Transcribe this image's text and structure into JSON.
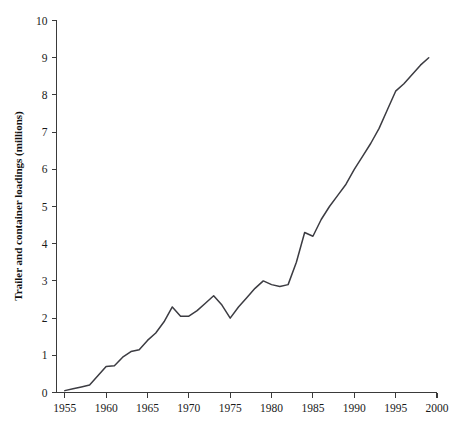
{
  "chart_data": {
    "type": "line",
    "title": "",
    "subtitle": "",
    "xlabel": "",
    "ylabel": "Trailer and container loadings (millions)",
    "xlim": [
      1954,
      2000
    ],
    "ylim": [
      0,
      10
    ],
    "xticks": [
      1955,
      1960,
      1965,
      1970,
      1975,
      1980,
      1985,
      1990,
      1995,
      2000
    ],
    "yticks": [
      0,
      1,
      2,
      3,
      4,
      5,
      6,
      7,
      8,
      9,
      10
    ],
    "grid": false,
    "legend": null,
    "legend_position": "none",
    "line_color": "#3c3c42",
    "axis_color": "#3a3a3a",
    "series": [
      {
        "name": "Trailer and container loadings",
        "x": [
          1955,
          1956,
          1957,
          1958,
          1959,
          1960,
          1961,
          1962,
          1963,
          1964,
          1965,
          1966,
          1967,
          1968,
          1969,
          1970,
          1971,
          1972,
          1973,
          1974,
          1975,
          1976,
          1977,
          1978,
          1979,
          1980,
          1981,
          1982,
          1983,
          1984,
          1985,
          1986,
          1987,
          1988,
          1989,
          1990,
          1991,
          1992,
          1993,
          1994,
          1995,
          1996,
          1997,
          1998,
          1999
        ],
        "values": [
          0.05,
          0.1,
          0.15,
          0.2,
          0.45,
          0.7,
          0.72,
          0.95,
          1.1,
          1.15,
          1.4,
          1.6,
          1.9,
          2.3,
          2.05,
          2.05,
          2.2,
          2.4,
          2.6,
          2.35,
          2.0,
          2.3,
          2.55,
          2.8,
          3.0,
          2.9,
          2.85,
          2.9,
          3.5,
          4.3,
          4.2,
          4.65,
          5.0,
          5.3,
          5.6,
          6.0,
          6.35,
          6.7,
          7.1,
          7.6,
          8.1,
          8.3,
          8.55,
          8.8,
          9.0
        ]
      }
    ],
    "annotations": []
  }
}
